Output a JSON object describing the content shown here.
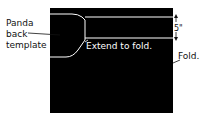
{
  "diagram": {
    "labels": {
      "template_line1": "Panda",
      "template_line2": "back",
      "template_line3": "template",
      "extend": "Extend to fold.",
      "fold": "Fold.",
      "dimension": "5\""
    },
    "colors": {
      "background": "#ffffff",
      "panel": "#000000",
      "outline": "#ffffff",
      "text": "#111111"
    }
  }
}
